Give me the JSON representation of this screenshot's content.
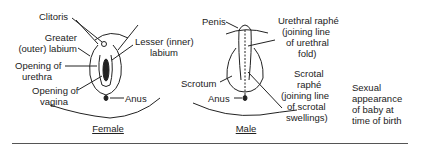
{
  "female": {
    "caption": "Female",
    "labels": {
      "clitoris": "Clitoris",
      "greater_labium_1": "Greater",
      "greater_labium_2": "(outer) labium",
      "lesser_labium_1": "Lesser (inner)",
      "lesser_labium_2": "labium",
      "urethra_1": "Opening of",
      "urethra_2": "urethra",
      "vagina_1": "Opening of",
      "vagina_2": "vagina",
      "anus": "Anus"
    }
  },
  "male": {
    "caption": "Male",
    "labels": {
      "penis": "Penis",
      "urethral_raphe_1": "Urethral raphé",
      "urethral_raphe_2": "(joining line",
      "urethral_raphe_3": "of urethral",
      "urethral_raphe_4": "fold)",
      "scrotum": "Scrotum",
      "scrotal_raphe_1": "Scrotal",
      "scrotal_raphe_2": "raphé",
      "scrotal_raphe_3": "(joining line",
      "scrotal_raphe_4": "of scrotal",
      "scrotal_raphe_5": "swellings)",
      "anus": "Anus"
    }
  },
  "side_caption": {
    "line1": "Sexual",
    "line2": "appearance",
    "line3": "of baby at",
    "line4": "time of birth"
  }
}
